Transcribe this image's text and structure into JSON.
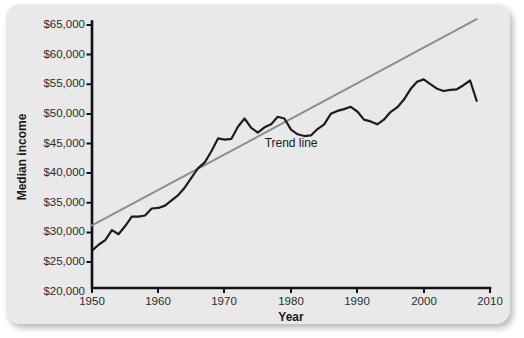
{
  "figure": {
    "background_color": "#e9e9e9",
    "plot": {
      "x_pixel_left": 92,
      "x_pixel_right": 490,
      "y_pixel_top": 21,
      "y_pixel_bottom": 288
    }
  },
  "chart_data": {
    "type": "line",
    "title": "",
    "xlabel": "Year",
    "ylabel": "Median income",
    "xlim": [
      1950,
      2010
    ],
    "ylim": [
      20000,
      65000
    ],
    "xticks": [
      1950,
      1960,
      1970,
      1980,
      1990,
      2000,
      2010
    ],
    "xticklabels": [
      "1950",
      "1960",
      "1970",
      "1980",
      "1990",
      "2000",
      "2010"
    ],
    "yticks": [
      20000,
      25000,
      30000,
      35000,
      40000,
      45000,
      50000,
      55000,
      60000,
      65000
    ],
    "yticklabels": [
      "$20,000",
      "$25,000",
      "$30,000",
      "$35,000",
      "$40,000",
      "$45,000",
      "$50,000",
      "$55,000",
      "$60,000",
      "$65,000"
    ],
    "grid": false,
    "legend": "none",
    "annotations": [
      {
        "text": "Trend line",
        "x": 1981,
        "y": 44200
      }
    ],
    "series": [
      {
        "name": "Median income",
        "type": "line",
        "color": "#1c1c1c",
        "x": [
          1950,
          1951,
          1952,
          1953,
          1954,
          1955,
          1956,
          1957,
          1958,
          1959,
          1960,
          1961,
          1962,
          1963,
          1964,
          1965,
          1966,
          1967,
          1968,
          1969,
          1970,
          1971,
          1972,
          1973,
          1974,
          1975,
          1976,
          1977,
          1978,
          1979,
          1980,
          1981,
          1982,
          1983,
          1984,
          1985,
          1986,
          1987,
          1988,
          1989,
          1990,
          1991,
          1992,
          1993,
          1994,
          1995,
          1996,
          1997,
          1998,
          1999,
          2000,
          2001,
          2002,
          2003,
          2004,
          2005,
          2006,
          2007,
          2008
        ],
        "values": [
          26400,
          27400,
          28200,
          29900,
          29200,
          30600,
          32200,
          32200,
          32400,
          33600,
          33700,
          34100,
          35000,
          35900,
          37200,
          38900,
          40500,
          41500,
          43400,
          45600,
          45400,
          45500,
          47600,
          49000,
          47400,
          46600,
          47500,
          48000,
          49300,
          49000,
          47100,
          46300,
          46000,
          46100,
          47200,
          48000,
          49800,
          50300,
          50600,
          51000,
          50200,
          48800,
          48500,
          48000,
          48800,
          50100,
          50900,
          52200,
          54000,
          55300,
          55700,
          54900,
          54100,
          53700,
          53900,
          54000,
          54700,
          55500,
          52000
        ],
        "note": "values read from axis; line begins at about $26,400 in 1950 and ends about $62,000 in 2008"
      },
      {
        "name": "Trend line",
        "type": "line",
        "color": "#8d8d8d",
        "x": [
          1950,
          2008
        ],
        "values": [
          30700,
          66000
        ]
      }
    ]
  },
  "labels": {
    "y_axis_title": "Median income",
    "x_axis_title": "Year",
    "trend_label": "Trend line"
  }
}
